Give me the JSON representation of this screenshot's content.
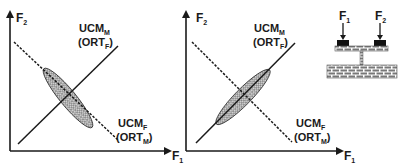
{
  "figure": {
    "panels": [
      {
        "id": "panel-a",
        "x_axis_label": "F",
        "x_axis_sub": "1",
        "y_axis_label": "F",
        "y_axis_sub": "2",
        "solid_line_label": {
          "main": "UCM",
          "main_sub": "M",
          "paren": "(ORT",
          "paren_sub": "F",
          "close": ")"
        },
        "dashed_line_label": {
          "main": "UCM",
          "main_sub": "F",
          "paren": "(ORT",
          "paren_sub": "M",
          "close": ")"
        },
        "ellipse_aligned_with": "dashed line (UCM_F)"
      },
      {
        "id": "panel-b",
        "x_axis_label": "F",
        "x_axis_sub": "1",
        "y_axis_label": "F",
        "y_axis_sub": "2",
        "solid_line_label": {
          "main": "UCM",
          "main_sub": "M",
          "paren": "(ORT",
          "paren_sub": "F",
          "close": ")"
        },
        "dashed_line_label": {
          "main": "UCM",
          "main_sub": "F",
          "paren": "(ORT",
          "paren_sub": "M",
          "close": ")"
        },
        "ellipse_aligned_with": "solid line (UCM_M)"
      }
    ],
    "apparatus": {
      "force1_label": "F",
      "force1_sub": "1",
      "force2_label": "F",
      "force2_sub": "2"
    },
    "colors": {
      "ink": "#1a1a1a",
      "ellipse_fill": "#9a9a9a",
      "brick": "#8a8a8a"
    }
  }
}
